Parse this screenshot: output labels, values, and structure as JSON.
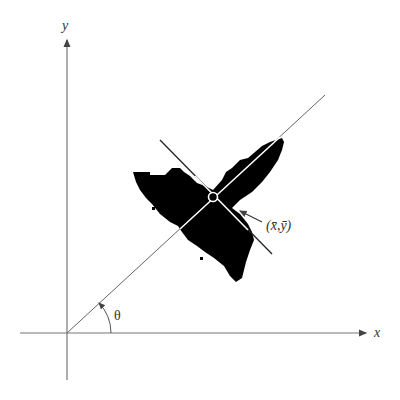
{
  "diagram": {
    "type": "principal-axes-of-blob",
    "axes": {
      "x_label": "x",
      "y_label": "y"
    },
    "angle_label": "θ",
    "centroid_label": "(x̄,ȳ)",
    "colors": {
      "axis": "#777777",
      "blob": "#000000",
      "major_axis_on_blob": "#ffffff",
      "minor_axis": "#222222",
      "background": "#ffffff"
    },
    "geometry": {
      "origin": [
        67,
        333
      ],
      "centroid": [
        213,
        197
      ],
      "x_axis_end": [
        368,
        333
      ],
      "y_axis_end": [
        67,
        38
      ],
      "major_axis": {
        "from": [
          67,
          333
        ],
        "to": [
          325,
          95
        ]
      },
      "minor_axis": {
        "from": [
          160,
          140
        ],
        "to": [
          272,
          254
        ]
      },
      "theta_arc_radius": 44
    }
  }
}
